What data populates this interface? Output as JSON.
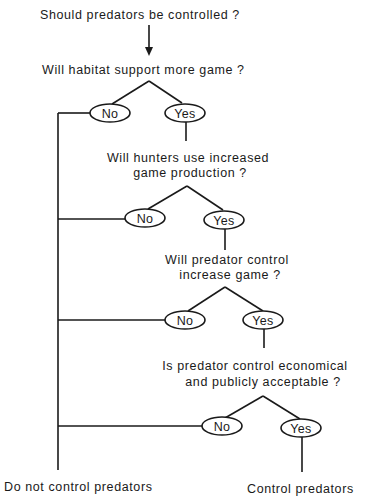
{
  "diagram": {
    "title": "Should predators be controlled ?",
    "questions": [
      {
        "lines": [
          "Will habitat support more game ?"
        ]
      },
      {
        "lines": [
          "Will hunters use increased",
          "game production ?"
        ]
      },
      {
        "lines": [
          "Will predator control",
          "increase game ?"
        ]
      },
      {
        "lines": [
          "Is predator control economical",
          "and publicly acceptable ?"
        ]
      }
    ],
    "branches": {
      "no_label": "No",
      "yes_label": "Yes"
    },
    "outcomes": {
      "negative": "Do not control predators",
      "positive": "Control predators"
    },
    "colors": {
      "ink": "#1a1a1a",
      "background": "#ffffff"
    }
  }
}
